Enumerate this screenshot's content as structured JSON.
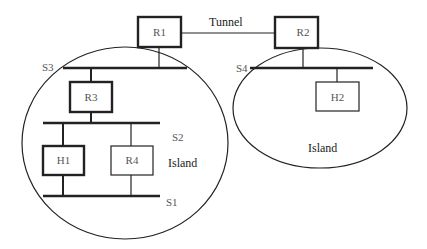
{
  "diagram": {
    "type": "network-topology",
    "colors": {
      "stroke": "#222222",
      "text": "#333333",
      "background": "#ffffff"
    },
    "links": {
      "tunnel_label": "Tunnel"
    },
    "islands": [
      {
        "id": "left",
        "label": "Island"
      },
      {
        "id": "right",
        "label": "Island"
      }
    ],
    "nodes": {
      "r1": "R1",
      "r2": "R2",
      "r3": "R3",
      "r4": "R4",
      "h1": "H1",
      "h2": "H2"
    },
    "segments": {
      "s1": "S1",
      "s2": "S2",
      "s3": "S3",
      "s4": "S4"
    }
  }
}
